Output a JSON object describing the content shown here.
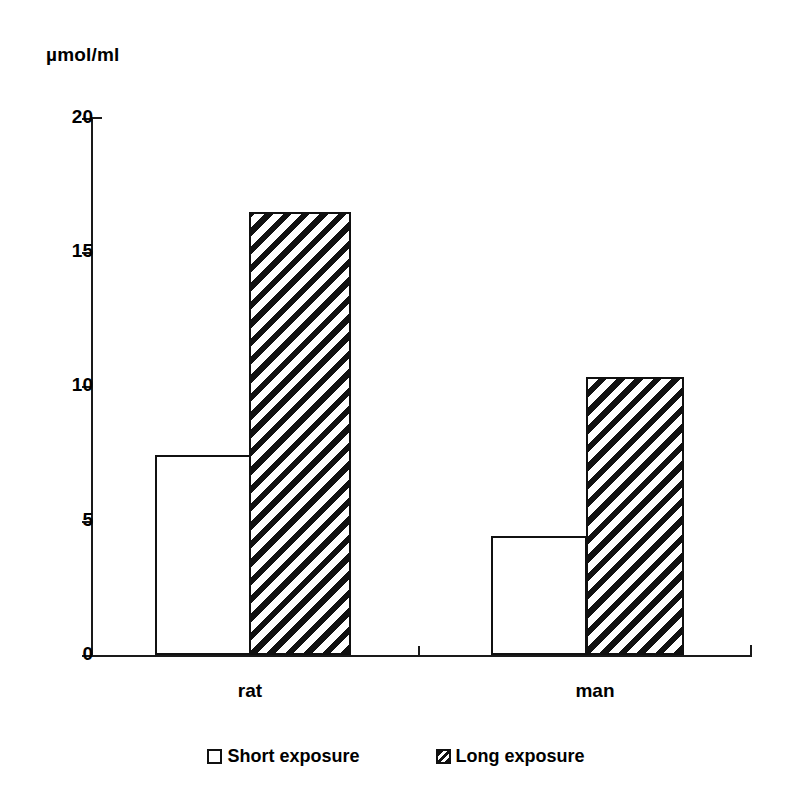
{
  "chart_data": {
    "type": "bar",
    "title": "",
    "subtitle": "",
    "xlabel": "",
    "ylabel": "µmol/ml",
    "categories": [
      "rat",
      "man"
    ],
    "series": [
      {
        "name": "Short exposure",
        "pattern": "open",
        "values": [
          7.45,
          4.45
        ]
      },
      {
        "name": "Long exposure",
        "pattern": "diagonal-hatch",
        "values": [
          16.5,
          10.35
        ]
      }
    ],
    "ylim": [
      0,
      20
    ],
    "yticks": [
      0,
      5,
      10,
      15,
      20
    ],
    "ytick_labels": [
      "0",
      "5",
      "10",
      "15",
      "20"
    ],
    "grid": false,
    "legend_position": "bottom",
    "colors": {
      "axis": "#1a1a1a",
      "bar_outline": "#111111",
      "bar_fill_open": "#ffffff",
      "hatch": "#111111",
      "background": "#ffffff"
    }
  },
  "axis": {
    "unit_label": "µmol/ml",
    "ticks": [
      {
        "label": "20",
        "value": 20
      },
      {
        "label": "15",
        "value": 15
      },
      {
        "label": "10",
        "value": 10
      },
      {
        "label": "5",
        "value": 5
      },
      {
        "label": "0",
        "value": 0
      }
    ]
  },
  "categories": [
    {
      "label": "rat"
    },
    {
      "label": "man"
    }
  ],
  "legend": {
    "items": [
      {
        "label": "Short exposure",
        "marker": "open-square-icon"
      },
      {
        "label": "Long exposure",
        "marker": "hatched-square-icon"
      }
    ]
  }
}
